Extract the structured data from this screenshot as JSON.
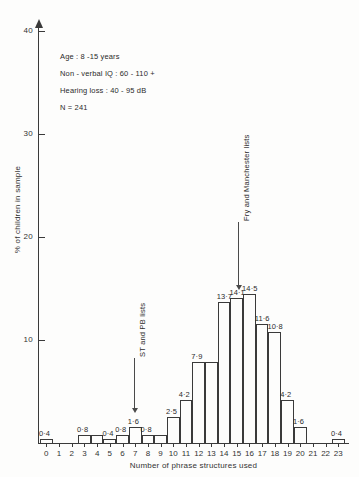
{
  "chart_data": {
    "type": "bar",
    "title": "",
    "xlabel": "Number of phrase structures used",
    "ylabel": "% of children in sample",
    "ylim": [
      0,
      40
    ],
    "yticks": [
      10,
      20,
      30,
      40
    ],
    "grid": false,
    "legend": "none",
    "categories": [
      "0",
      "1",
      "2",
      "3",
      "4",
      "5",
      "6",
      "7",
      "8",
      "9",
      "10",
      "11",
      "12",
      "13",
      "14",
      "15",
      "16",
      "17",
      "18",
      "19",
      "20",
      "21",
      "22",
      "23"
    ],
    "values": [
      0.4,
      0,
      0,
      0.8,
      0.8,
      0.4,
      0.8,
      1.6,
      0.8,
      0.8,
      2.5,
      4.2,
      7.9,
      7.9,
      13.7,
      14.1,
      14.5,
      11.6,
      10.8,
      4.2,
      1.6,
      0,
      0,
      0.4
    ],
    "bar_labels": [
      "0·4",
      "",
      "",
      "0·8",
      "",
      "0·4",
      "0·8",
      "1·6",
      "0·8",
      "",
      "2·5",
      "4·2",
      "7·9",
      "",
      "13·7",
      "14·1",
      "14·5",
      "11·6",
      "10·8",
      "4·2",
      "1·6",
      "",
      "",
      "0·4"
    ],
    "annotations": [
      {
        "text": "ST and PB lists",
        "points_to_category": "7"
      },
      {
        "text": "Fry and Manchester lists",
        "points_to_category": "15"
      }
    ]
  },
  "info_box": {
    "lines": [
      "Age : 8 -15 years",
      "Non - verbal IQ : 60 - 110 +",
      "Hearing loss : 40 - 95 dB",
      "N = 241"
    ]
  },
  "colors": {
    "ink": "#3a3a3a",
    "paper": "#fdfdfc"
  }
}
